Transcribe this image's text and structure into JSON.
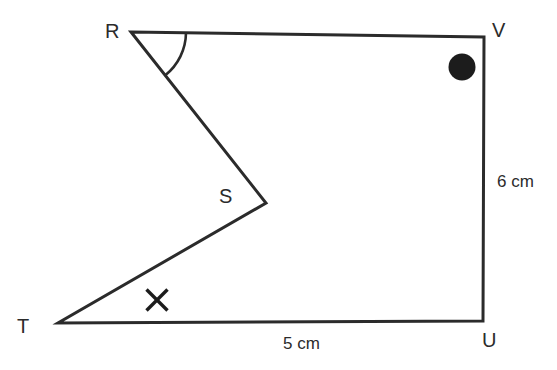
{
  "figure": {
    "background_color": "#ffffff",
    "stroke_color": "#2b2b2b",
    "marker_color": "#1c1c1c",
    "vertices": [
      {
        "name": "R",
        "label": "R",
        "x": 131,
        "y": 32,
        "label_x": 105,
        "label_y": 38
      },
      {
        "name": "V",
        "label": "V",
        "x": 484,
        "y": 37,
        "label_x": 492,
        "label_y": 37
      },
      {
        "name": "U",
        "label": "U",
        "x": 483,
        "y": 321,
        "label_x": 482,
        "label_y": 347
      },
      {
        "name": "T",
        "label": "T",
        "x": 58,
        "y": 323,
        "label_x": 17,
        "label_y": 333
      },
      {
        "name": "S",
        "label": "S",
        "x": 266,
        "y": 203,
        "label_x": 219,
        "label_y": 203
      }
    ],
    "outline_path": "M 131 32 L 484 37 L 483 321 L 58 323 L 266 203 Z",
    "edges": [
      {
        "name": "RV",
        "from": "R",
        "to": "V",
        "measure": ""
      },
      {
        "name": "VU",
        "from": "V",
        "to": "U",
        "measure": "6 cm"
      },
      {
        "name": "UT",
        "from": "U",
        "to": "T",
        "measure": "5 cm"
      },
      {
        "name": "TS",
        "from": "T",
        "to": "S",
        "measure": ""
      },
      {
        "name": "SR",
        "from": "S",
        "to": "R",
        "measure": ""
      }
    ],
    "measure_labels": [
      {
        "name": "side-vu-length",
        "text": "6 cm",
        "x": 497,
        "y": 187
      },
      {
        "name": "side-tu-length",
        "text": "5 cm",
        "x": 283,
        "y": 349
      }
    ],
    "angle_marker": {
      "name": "angle-arc-at-R",
      "at_vertex": "R",
      "radius": 55,
      "arc_path": "M 186 32.8 A 55 55 0 0 1 165.3 75.2"
    },
    "dot_marker": {
      "name": "filled-circle-marker",
      "cx": 462,
      "cy": 67,
      "r": 13.5
    },
    "cross_marker": {
      "name": "cross-tick-marker",
      "cx": 157,
      "cy": 300,
      "half": 11
    }
  }
}
